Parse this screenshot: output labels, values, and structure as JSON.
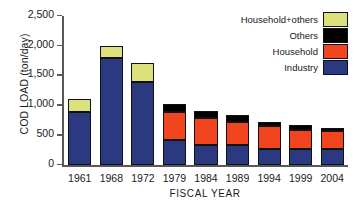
{
  "chart_data": {
    "type": "bar",
    "title": "",
    "subtitle": "",
    "xlabel": "FISCAL YEAR",
    "ylabel": "COD LOAD (ton/day)",
    "stacked": true,
    "grid": false,
    "legend_position": "top-right",
    "ylim": [
      0,
      2500
    ],
    "yticks": [
      0,
      500,
      1000,
      1500,
      2000,
      2500
    ],
    "ytick_labels": [
      "0",
      "500",
      "1,000",
      "1,500",
      "2,000",
      "2,500"
    ],
    "categories": [
      "1961",
      "1968",
      "1972",
      "1979",
      "1984",
      "1989",
      "1994",
      "1999",
      "2004"
    ],
    "series": [
      {
        "name": "Industry",
        "color": "#2b3a80",
        "values": [
          890,
          1800,
          1400,
          430,
          350,
          350,
          280,
          280,
          275
        ]
      },
      {
        "name": "Household",
        "color": "#f0451f",
        "values": [
          0,
          0,
          0,
          470,
          450,
          375,
          375,
          320,
          300
        ]
      },
      {
        "name": "Others",
        "color": "#000000",
        "values": [
          0,
          0,
          0,
          120,
          115,
          120,
          80,
          70,
          55
        ]
      },
      {
        "name": "Household+others",
        "color": "#dde17c",
        "values": [
          230,
          200,
          310,
          0,
          0,
          0,
          0,
          0,
          0
        ]
      }
    ],
    "totals": [
      1120,
      2000,
      1710,
      1020,
      915,
      845,
      735,
      670,
      630
    ],
    "legend": [
      {
        "label": "Household+others",
        "color": "#dde17c"
      },
      {
        "label": "Others",
        "color": "#000000"
      },
      {
        "label": "Household",
        "color": "#f0451f"
      },
      {
        "label": "Industry",
        "color": "#2b3a80"
      }
    ]
  }
}
